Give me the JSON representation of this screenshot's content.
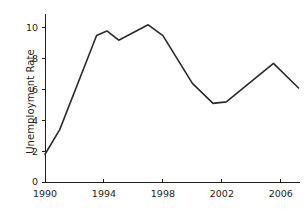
{
  "chart_data": {
    "type": "line",
    "title": "",
    "xlabel": "",
    "ylabel": "Unemployment Rate",
    "xlim": [
      1990,
      2007.3
    ],
    "ylim": [
      0,
      10.9
    ],
    "grid": false,
    "legend": "none",
    "xticks": [
      1990,
      1994,
      1998,
      2002,
      2006
    ],
    "xtick_labels": [
      "1990",
      "1994",
      "1998",
      "2002",
      "2006"
    ],
    "yticks": [
      0,
      2,
      4,
      6,
      8,
      10
    ],
    "ytick_labels": [
      "0",
      "2",
      "4",
      "6",
      "8",
      "10"
    ],
    "series": [
      {
        "name": "Unemployment Rate",
        "color": "#2b2b2b",
        "x": [
          1990.0,
          1991.0,
          1993.5,
          1994.2,
          1995.0,
          1997.0,
          1998.0,
          2000.0,
          2001.4,
          2002.3,
          2005.5,
          2007.2
        ],
        "values": [
          1.8,
          3.4,
          9.5,
          9.8,
          9.2,
          10.2,
          9.5,
          6.4,
          5.1,
          5.2,
          7.7,
          6.1
        ]
      }
    ]
  },
  "axis": {
    "y_title": "Unemployment Rate"
  }
}
